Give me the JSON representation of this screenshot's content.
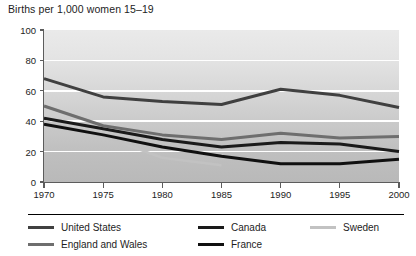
{
  "chart_data": {
    "type": "line",
    "title": "Births per 1,000 women 15–19",
    "xlabel": "",
    "ylabel": "",
    "xlim": [
      1970,
      2000
    ],
    "ylim": [
      0,
      100
    ],
    "grid": true,
    "legend_position": "bottom",
    "x": [
      1970,
      1975,
      1980,
      1985,
      1990,
      1995,
      2000
    ],
    "xtick_labels": [
      "1970",
      "1975",
      "1980",
      "1985",
      "1990",
      "1995",
      "2000"
    ],
    "ytick_labels": [
      "0",
      "20",
      "40",
      "60",
      "80",
      "100"
    ],
    "ytick_values": [
      0,
      20,
      40,
      60,
      80,
      100
    ],
    "series": [
      {
        "name": "United States",
        "color": "#404040",
        "width": 3.0,
        "values": [
          68,
          56,
          53,
          51,
          61,
          57,
          49
        ]
      },
      {
        "name": "Canada",
        "color": "#1a1a1a",
        "width": 3.0,
        "values": [
          42,
          35,
          28,
          23,
          26,
          25,
          20
        ]
      },
      {
        "name": "Sweden",
        "color": "#c2c2c2",
        "width": 2.6,
        "values": [
          40,
          30,
          16,
          11,
          null,
          null,
          null
        ]
      },
      {
        "name": "England and Wales",
        "color": "#6e6e6e",
        "width": 3.0,
        "values": [
          50,
          37,
          31,
          28,
          32,
          29,
          30
        ]
      },
      {
        "name": "France",
        "color": "#101010",
        "width": 3.0,
        "values": [
          38,
          31,
          23,
          17,
          12,
          12,
          15
        ]
      }
    ]
  },
  "legend": {
    "rows": [
      [
        {
          "label": "United States",
          "color": "#404040"
        },
        {
          "label": "Canada",
          "color": "#1a1a1a"
        },
        {
          "label": "Sweden",
          "color": "#c2c2c2"
        }
      ],
      [
        {
          "label": "England and Wales",
          "color": "#6e6e6e"
        },
        {
          "label": "France",
          "color": "#101010"
        }
      ]
    ]
  }
}
